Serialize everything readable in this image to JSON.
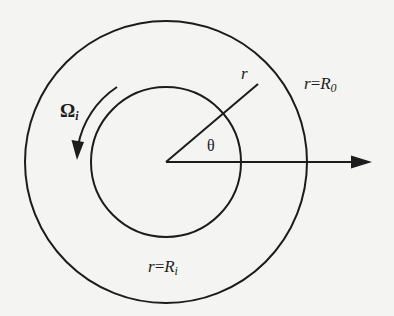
{
  "diagram": {
    "title": "",
    "colors": {
      "background": "#f4f4f2",
      "stroke": "#1c1c1c"
    },
    "geometry": {
      "center": [
        166,
        162
      ],
      "inner_radius": 75,
      "outer_radius": 141,
      "rotation_arc_radius": 90,
      "radial_line_end": [
        258,
        84
      ],
      "axis_arrow_end": [
        372,
        162
      ]
    },
    "labels": {
      "omega_symbol": "Ω",
      "omega_subscript": "i",
      "radial_label": "r",
      "angle_label": "θ",
      "outer_boundary_lhs": "r",
      "outer_boundary_eq": "=",
      "outer_boundary_sym": "R",
      "outer_boundary_sub": "0",
      "inner_boundary_lhs": "r",
      "inner_boundary_eq": "=",
      "inner_boundary_sym": "R",
      "inner_boundary_sub": "i"
    },
    "elements": [
      {
        "type": "circle",
        "name": "outer-cylinder",
        "radius_label": "r = R0"
      },
      {
        "type": "circle",
        "name": "inner-cylinder",
        "radius_label": "r = Ri"
      },
      {
        "type": "arc-arrow",
        "name": "rotation",
        "label": "Ωi",
        "direction": "counterclockwise"
      },
      {
        "type": "line",
        "name": "radial-coordinate",
        "label": "r"
      },
      {
        "type": "arrow",
        "name": "reference-axis",
        "direction": "+x"
      },
      {
        "type": "angle",
        "name": "theta",
        "label": "θ"
      }
    ]
  }
}
